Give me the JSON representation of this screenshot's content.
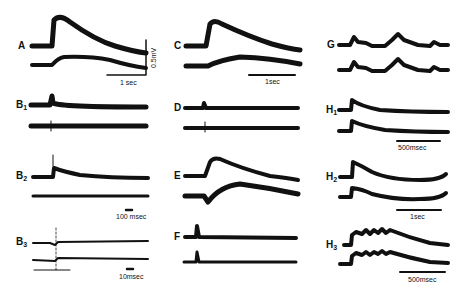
{
  "figure": {
    "panels": [
      {
        "id": "A",
        "label": "A",
        "sub": "",
        "scale": "1 sec",
        "vscale": "0.5mV"
      },
      {
        "id": "B1",
        "label": "B",
        "sub": "1",
        "scale": ""
      },
      {
        "id": "B2",
        "label": "B",
        "sub": "2",
        "scale": "100 msec"
      },
      {
        "id": "B3",
        "label": "B",
        "sub": "3",
        "scale": "10msec"
      },
      {
        "id": "C",
        "label": "C",
        "sub": "",
        "scale": "1sec"
      },
      {
        "id": "D",
        "label": "D",
        "sub": "",
        "scale": ""
      },
      {
        "id": "E",
        "label": "E",
        "sub": "",
        "scale": ""
      },
      {
        "id": "F",
        "label": "F",
        "sub": "",
        "scale": ""
      },
      {
        "id": "G",
        "label": "G",
        "sub": "",
        "scale": ""
      },
      {
        "id": "H1",
        "label": "H",
        "sub": "1",
        "scale": "500msec"
      },
      {
        "id": "H2",
        "label": "H",
        "sub": "2",
        "scale": "1sec"
      },
      {
        "id": "H3",
        "label": "H",
        "sub": "3",
        "scale": "500msec"
      }
    ],
    "trace_color": "#111111",
    "background": "#ffffff"
  }
}
